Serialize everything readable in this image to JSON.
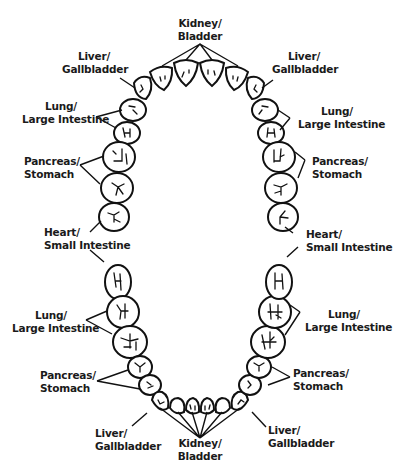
{
  "colors": {
    "ink": "#111111",
    "background": "#ffffff"
  },
  "upper": {
    "center": {
      "line1": "Kidney/",
      "line2": "Bladder"
    },
    "left": [
      {
        "line1": "Liver/",
        "line2": "Gallbladder"
      },
      {
        "line1": "Lung/",
        "line2": "Large Intestine"
      },
      {
        "line1": "Pancreas/",
        "line2": "Stomach"
      },
      {
        "line1": "Heart/",
        "line2": "Small Intestine"
      }
    ],
    "right": [
      {
        "line1": "Liver/",
        "line2": "Gallbladder"
      },
      {
        "line1": "Lung/",
        "line2": "Large Intestine"
      },
      {
        "line1": "Pancreas/",
        "line2": "Stomach"
      },
      {
        "line1": "Heart/",
        "line2": "Small Intestine"
      }
    ]
  },
  "lower": {
    "center": {
      "line1": "Kidney/",
      "line2": "Bladder"
    },
    "left": [
      {
        "line1": "Lung/",
        "line2": "Large Intestine"
      },
      {
        "line1": "Pancreas/",
        "line2": "Stomach"
      },
      {
        "line1": "Liver/",
        "line2": "Gallbladder"
      }
    ],
    "right": [
      {
        "line1": "Lung/",
        "line2": "Large Intestine"
      },
      {
        "line1": "Pancreas/",
        "line2": "Stomach"
      },
      {
        "line1": "Liver/",
        "line2": "Gallbladder"
      }
    ]
  }
}
